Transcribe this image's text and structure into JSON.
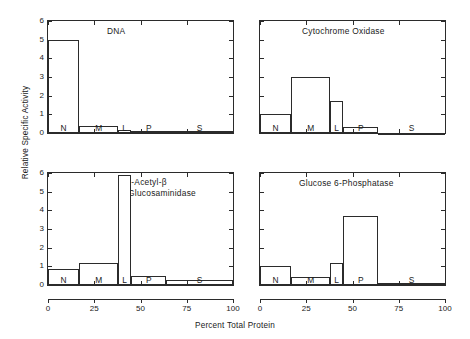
{
  "figure": {
    "ylabel": "Relative Specific Activity",
    "xlabel": "Percent Total Protein",
    "y_ticks": [
      "0",
      "1",
      "2",
      "3",
      "4",
      "5",
      "6"
    ],
    "x_ticks": [
      "0",
      "25",
      "50",
      "75",
      "100"
    ],
    "fraction_labels": [
      "N",
      "M",
      "L",
      "P",
      "S"
    ]
  },
  "chart_data": [
    {
      "type": "bar",
      "title": "DNA",
      "panel": "top-left",
      "xlabel": "Percent Total Protein",
      "ylabel": "Relative Specific Activity",
      "xlim": [
        0,
        100
      ],
      "ylim": [
        0,
        6
      ],
      "grid": false,
      "categories": [
        "N",
        "M",
        "L",
        "P",
        "S"
      ],
      "values": [
        5.0,
        0.4,
        0.15,
        0.1,
        0.1
      ],
      "x_edges": [
        0,
        17,
        38,
        45,
        64,
        100
      ],
      "note": "Bar width proportional to percent total protein of each fraction"
    },
    {
      "type": "bar",
      "title": "Cytochrome Oxidase",
      "panel": "top-right",
      "xlabel": "Percent Total Protein",
      "ylabel": "Relative Specific Activity",
      "xlim": [
        0,
        100
      ],
      "ylim": [
        0,
        6
      ],
      "grid": false,
      "categories": [
        "N",
        "M",
        "L",
        "P",
        "S"
      ],
      "values": [
        1.0,
        3.0,
        1.7,
        0.3,
        0.0
      ],
      "x_edges": [
        0,
        17,
        38,
        45,
        64,
        100
      ]
    },
    {
      "type": "bar",
      "title": "N-Acetyl-β -Glucosaminidase",
      "title_line1": "N-Acetyl-β",
      "title_line2": "-Glucosaminidase",
      "panel": "bottom-left",
      "xlabel": "Percent Total Protein",
      "ylabel": "Relative Specific Activity",
      "xlim": [
        0,
        100
      ],
      "ylim": [
        0,
        6
      ],
      "grid": false,
      "categories": [
        "N",
        "M",
        "L",
        "P",
        "S"
      ],
      "values": [
        0.85,
        1.2,
        5.9,
        0.5,
        0.25
      ],
      "x_edges": [
        0,
        17,
        38,
        45,
        64,
        100
      ]
    },
    {
      "type": "bar",
      "title": "Glucose 6-Phosphatase",
      "panel": "bottom-right",
      "xlabel": "Percent Total Protein",
      "ylabel": "Relative Specific Activity",
      "xlim": [
        0,
        100
      ],
      "ylim": [
        0,
        6
      ],
      "grid": false,
      "categories": [
        "N",
        "M",
        "L",
        "P",
        "S"
      ],
      "values": [
        1.0,
        0.45,
        1.2,
        3.7,
        0.1
      ],
      "x_edges": [
        0,
        17,
        38,
        45,
        64,
        100
      ]
    }
  ],
  "panels": {
    "top_left": {
      "title": "DNA"
    },
    "top_right": {
      "title": "Cytochrome Oxidase"
    },
    "bottom_left": {
      "title_line1": "N-Acetyl-β",
      "title_line2": "-Glucosaminidase"
    },
    "bottom_right": {
      "title": "Glucose 6-Phosphatase"
    }
  },
  "colors": {
    "line": "#2b2b2b",
    "background": "#ffffff",
    "text": "#1a1a1a"
  }
}
